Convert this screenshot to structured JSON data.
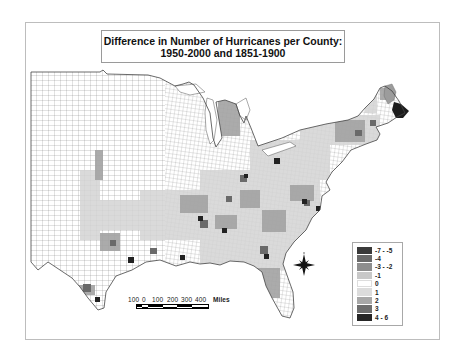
{
  "map": {
    "title_line1": "Difference in Number of Hurricanes per County:",
    "title_line2": "1950-2000 and 1851-1900",
    "region": "Eastern United States counties",
    "legend": {
      "items": [
        {
          "label": "-7 - -5",
          "color": "#3a3a3a"
        },
        {
          "label": "-4",
          "color": "#6a6a6a"
        },
        {
          "label": "-3 - -2",
          "color": "#8e8e8e"
        },
        {
          "label": "-1",
          "color": "#c8c8c8"
        },
        {
          "label": "0",
          "color": "#ffffff"
        },
        {
          "label": "1",
          "color": "#dcdcdc"
        },
        {
          "label": "2",
          "color": "#a8a8a8"
        },
        {
          "label": "3",
          "color": "#6e6e6e"
        },
        {
          "label": "4 - 6",
          "color": "#262626"
        }
      ]
    },
    "scale_bar": {
      "ticks": [
        "100",
        "0",
        "100",
        "200",
        "300",
        "400"
      ],
      "unit": "Miles"
    },
    "north_arrow": "compass-rose"
  }
}
